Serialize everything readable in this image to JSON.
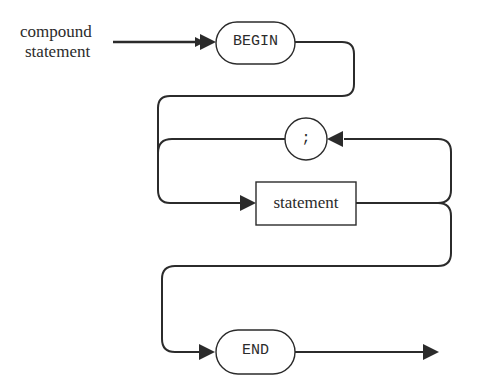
{
  "diagram": {
    "type": "syntax-diagram",
    "entry_label_line1": "compound",
    "entry_label_line2": "statement",
    "nodes": {
      "begin": {
        "label": "BEGIN",
        "shape": "rounded-terminal"
      },
      "semicolon": {
        "label": ";",
        "shape": "circle-terminal"
      },
      "statement": {
        "label": "statement",
        "shape": "rectangle-nonterminal"
      },
      "end": {
        "label": "END",
        "shape": "rounded-terminal"
      }
    },
    "edges": [
      {
        "from": "entry",
        "to": "begin"
      },
      {
        "from": "begin",
        "to": "statement"
      },
      {
        "from": "statement",
        "to": "semicolon"
      },
      {
        "from": "semicolon",
        "to": "statement"
      },
      {
        "from": "statement",
        "to": "end"
      },
      {
        "from": "end",
        "to": "exit"
      }
    ],
    "colors": {
      "line": "#2b2b2b",
      "background": "#ffffff"
    }
  }
}
